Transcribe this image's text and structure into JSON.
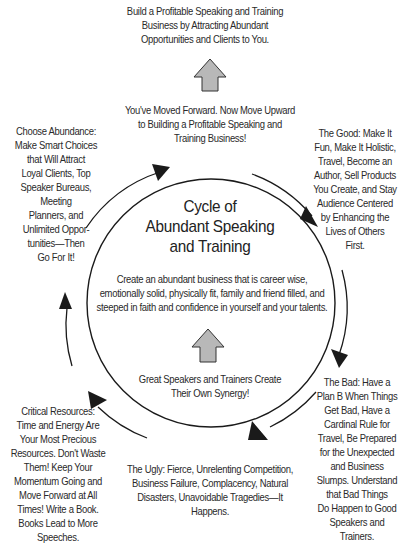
{
  "diagram": {
    "title": "Cycle of\nAbundant Speaking\nand Training",
    "top_goal": "Build a Profitable Speaking and Training\nBusiness by Attracting Abundant\nOpportunities and Clients to You.",
    "move_upward": "You've Moved Forward. Now Move Upward\nto Building a Profitable Speaking and\nTraining Business!",
    "center_statement": "Create an abundant business that is career wise,\nemotionally solid, physically fit, family and friend filled, and\nsteeped in faith and confidence in yourself and your talents.",
    "synergy": "Great Speakers and Trainers Create\nTheir Own Synergy!",
    "stages": {
      "good": "The Good: Make It\nFun, Make It Holistic,\nTravel, Become an\nAuthor, Sell Products\nYou Create, and Stay\nAudience Centered\nby Enhancing the\nLives of Others\nFirst.",
      "bad": "The Bad: Have a\nPlan B When Things\nGet Bad, Have a\nCardinal Rule for\nTravel, Be Prepared\nfor the Unexpected\nand Business\nSlumps. Understand\nthat Bad Things\nDo Happen to Good\nSpeakers and\nTrainers.",
      "ugly": "The Ugly: Fierce, Unrelenting Competition,\nBusiness Failure, Complacency, Natural\nDisasters, Unavoidable Tragedies—It\nHappens.",
      "critical_resources": "Critical Resources:\nTime and Energy Are\nYour Most Precious\nResources. Don't Waste\nThem! Keep Your\nMomentum Going and\nMove Forward at All\nTimes! Write a Book.\nBooks Lead to More\nSpeeches.",
      "choose_abundance": "Choose Abundance:\nMake Smart Choices\nthat Will Attract\nLoyal Clients, Top\nSpeaker Bureaus,\nMeeting\nPlanners, and\nUnlimited Oppor-\ntunities—Then\nGo For It!"
    },
    "colors": {
      "line": "#1a1a1a",
      "arrow_fill": "#b8b8b8",
      "text": "#2a2a2a"
    }
  }
}
